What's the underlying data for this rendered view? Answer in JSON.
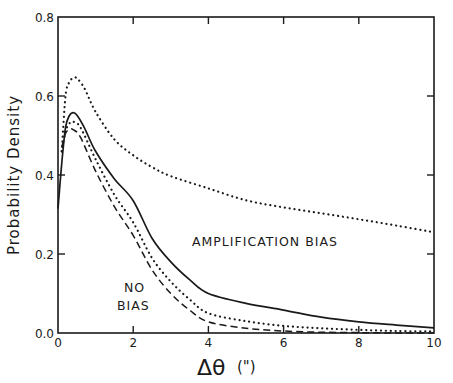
{
  "chart_data": {
    "type": "line",
    "title": "",
    "xlabel": "Δθ (\")",
    "ylabel": "Probability Density",
    "xlim": [
      0,
      10
    ],
    "ylim": [
      0.0,
      0.8
    ],
    "x_ticks": [
      "0",
      "2",
      "4",
      "6",
      "8",
      "10"
    ],
    "y_ticks": [
      "0.0",
      "0.2",
      "0.4",
      "0.6",
      "0.8"
    ],
    "grid": false,
    "legend": null,
    "annotations": [
      {
        "text": "AMPLIFICATION BIAS",
        "x": 4.9,
        "y": 0.235
      },
      {
        "text": "NO",
        "x": 1.15,
        "y": 0.14
      },
      {
        "text": "BIAS",
        "x": 1.15,
        "y": 0.085
      }
    ],
    "series": [
      {
        "name": "Amplification bias (solid)",
        "style": "solid",
        "x": [
          0.0,
          0.1,
          0.2,
          0.3,
          0.4,
          0.5,
          0.7,
          1.0,
          1.5,
          2.0,
          2.5,
          3.0,
          3.5,
          4.0,
          5.0,
          6.0,
          7.0,
          8.0,
          9.0,
          10.0
        ],
        "y": [
          0.315,
          0.43,
          0.52,
          0.55,
          0.558,
          0.552,
          0.52,
          0.46,
          0.39,
          0.335,
          0.24,
          0.18,
          0.135,
          0.1,
          0.075,
          0.058,
          0.04,
          0.028,
          0.02,
          0.013
        ]
      },
      {
        "name": "Upper dotted",
        "style": "dotted",
        "x": [
          0.1,
          0.2,
          0.3,
          0.4,
          0.5,
          0.7,
          1.0,
          1.5,
          2.0,
          2.5,
          3.0,
          4.0,
          5.0,
          6.0,
          7.0,
          8.0,
          9.0,
          10.0
        ],
        "y": [
          0.46,
          0.6,
          0.635,
          0.645,
          0.645,
          0.62,
          0.56,
          0.49,
          0.45,
          0.42,
          0.397,
          0.366,
          0.336,
          0.318,
          0.303,
          0.288,
          0.272,
          0.255
        ]
      },
      {
        "name": "Lower dotted",
        "style": "dotted",
        "x": [
          0.1,
          0.2,
          0.3,
          0.4,
          0.6,
          1.0,
          1.5,
          2.0,
          2.5,
          3.0,
          3.5,
          4.0,
          5.0,
          6.0,
          7.0,
          8.0,
          9.0,
          10.0
        ],
        "y": [
          0.46,
          0.51,
          0.53,
          0.535,
          0.52,
          0.44,
          0.35,
          0.28,
          0.19,
          0.13,
          0.085,
          0.05,
          0.03,
          0.018,
          0.012,
          0.008,
          0.005,
          0.004
        ]
      },
      {
        "name": "No bias (dashed)",
        "style": "dashed",
        "x": [
          0.1,
          0.2,
          0.3,
          0.4,
          0.6,
          1.0,
          1.5,
          2.0,
          2.5,
          3.0,
          3.5,
          4.0,
          5.0,
          6.0,
          7.0,
          8.0,
          9.0,
          10.0
        ],
        "y": [
          0.47,
          0.505,
          0.515,
          0.515,
          0.495,
          0.41,
          0.32,
          0.247,
          0.16,
          0.1,
          0.058,
          0.028,
          0.012,
          0.005,
          0.002,
          0.001,
          0.0,
          0.0
        ]
      }
    ]
  },
  "labels": {
    "ylabel": "Probability Density",
    "xlabel_symbol": "Δθ",
    "xlabel_unit": "(\")",
    "annot_amp": "AMPLIFICATION BIAS",
    "annot_no": "NO",
    "annot_bias": "BIAS"
  }
}
